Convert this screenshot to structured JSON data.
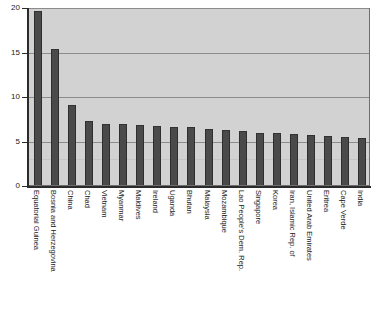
{
  "chart_data": {
    "type": "bar",
    "title": "",
    "subtitle": "",
    "xlabel": "",
    "ylabel": "",
    "ylim": [
      0,
      20
    ],
    "yticks": [
      0,
      5,
      10,
      15,
      20
    ],
    "grid": true,
    "legend": false,
    "orientation": "vertical",
    "bar_color": "#4a4a4a",
    "plot_background": "#d2d2d2",
    "categories": [
      "Equatorial Guinea",
      "Bosnia and Herzegovina",
      "China",
      "Chad",
      "Vietnam",
      "Myanmar",
      "Maldives",
      "Ireland",
      "Uganda",
      "Bhutan",
      "Malaysia",
      "Mozambique",
      "Lao People's Dem. Rep.",
      "Singapore",
      "Korea",
      "Iran, Islamic Rep. of",
      "United Arab Emirates",
      "Eritrea",
      "Cape Verde",
      "India"
    ],
    "values": [
      19.6,
      15.3,
      9.0,
      7.2,
      6.9,
      6.8,
      6.7,
      6.6,
      6.5,
      6.5,
      6.3,
      6.2,
      6.1,
      5.9,
      5.8,
      5.7,
      5.6,
      5.5,
      5.4,
      5.3
    ]
  },
  "axis": {
    "y_tick_labels": [
      "0",
      "5",
      "10",
      "15",
      "20"
    ]
  },
  "colors": {
    "bar": "#4a4a4a",
    "bar_edge": "#2e2e2e",
    "plot_bg": "#d2d2d2",
    "gridline": "#8c8c8c",
    "axis": "#2b2b2b",
    "page_bg": "#ffffff",
    "text": "#1a1a1a"
  }
}
